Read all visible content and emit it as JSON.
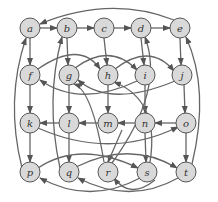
{
  "diagram": {
    "type": "directed-graph",
    "colors": {
      "node_fill": "#d9d9d9",
      "node_stroke": "#555555",
      "edge": "#555555",
      "background": "#ffffff"
    },
    "nodes": [
      {
        "id": "a",
        "label": "a",
        "x": 30,
        "y": 28
      },
      {
        "id": "b",
        "label": "b",
        "x": 67,
        "y": 28
      },
      {
        "id": "c",
        "label": "c",
        "x": 104,
        "y": 28
      },
      {
        "id": "d",
        "label": "d",
        "x": 141,
        "y": 28
      },
      {
        "id": "e",
        "label": "e",
        "x": 180,
        "y": 28
      },
      {
        "id": "f",
        "label": "f",
        "x": 30,
        "y": 75
      },
      {
        "id": "g",
        "label": "g",
        "x": 69,
        "y": 75
      },
      {
        "id": "h",
        "label": "h",
        "x": 108,
        "y": 75
      },
      {
        "id": "i",
        "label": "i",
        "x": 145,
        "y": 75
      },
      {
        "id": "j",
        "label": "j",
        "x": 182,
        "y": 75
      },
      {
        "id": "k",
        "label": "k",
        "x": 30,
        "y": 123
      },
      {
        "id": "l",
        "label": "l",
        "x": 69,
        "y": 123
      },
      {
        "id": "m",
        "label": "m",
        "x": 108,
        "y": 123
      },
      {
        "id": "n",
        "label": "n",
        "x": 145,
        "y": 123
      },
      {
        "id": "o",
        "label": "o",
        "x": 186,
        "y": 123
      },
      {
        "id": "p",
        "label": "p",
        "x": 30,
        "y": 172
      },
      {
        "id": "q",
        "label": "q",
        "x": 69,
        "y": 172
      },
      {
        "id": "r",
        "label": "r",
        "x": 108,
        "y": 172
      },
      {
        "id": "s",
        "label": "s",
        "x": 147,
        "y": 172
      },
      {
        "id": "t",
        "label": "t",
        "x": 186,
        "y": 172
      }
    ]
  }
}
